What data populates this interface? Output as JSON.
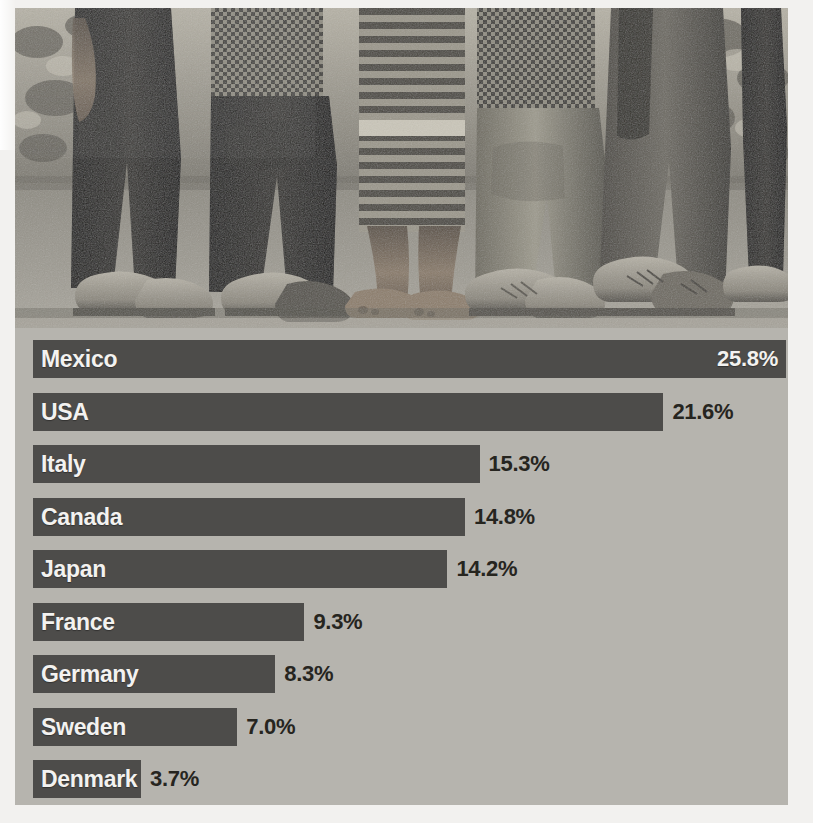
{
  "figure": {
    "type": "horizontal-bar-chart-over-photo",
    "photo_caption_alt": "Lower bodies and feet of a group of children standing on dirt ground, some in shoes, one barefoot"
  },
  "colors": {
    "bar": "#4d4c4a",
    "panel_background": "#b6b4ae",
    "page_background": "#ffffff",
    "label_text": "#f3f2f0",
    "value_text": "#26251f"
  },
  "chart_data": {
    "type": "bar",
    "orientation": "horizontal",
    "title": "",
    "xlabel": "",
    "ylabel": "",
    "grid": false,
    "legend": null,
    "value_suffix": "%",
    "xlim": [
      0,
      25.8
    ],
    "categories": [
      "Mexico",
      "USA",
      "Italy",
      "Canada",
      "Japan",
      "France",
      "Germany",
      "Sweden",
      "Denmark"
    ],
    "values": [
      25.8,
      21.6,
      15.3,
      14.8,
      14.2,
      9.3,
      8.3,
      7.0,
      3.7
    ],
    "value_labels": [
      "25.8%",
      "21.6%",
      "15.3%",
      "14.8%",
      "14.2%",
      "9.3%",
      "8.3%",
      "7.0%",
      "3.7%"
    ],
    "bars": [
      {
        "label": "Mexico",
        "value": 25.8,
        "value_label": "25.8%",
        "label_inside": true,
        "value_inside": true
      },
      {
        "label": "USA",
        "value": 21.6,
        "value_label": "21.6%",
        "label_inside": true,
        "value_inside": false
      },
      {
        "label": "Italy",
        "value": 15.3,
        "value_label": "15.3%",
        "label_inside": true,
        "value_inside": false
      },
      {
        "label": "Canada",
        "value": 14.8,
        "value_label": "14.8%",
        "label_inside": true,
        "value_inside": false
      },
      {
        "label": "Japan",
        "value": 14.2,
        "value_label": "14.2%",
        "label_inside": true,
        "value_inside": false
      },
      {
        "label": "France",
        "value": 9.3,
        "value_label": "9.3%",
        "label_inside": true,
        "value_inside": false
      },
      {
        "label": "Germany",
        "value": 8.3,
        "value_label": "8.3%",
        "label_inside": true,
        "value_inside": false
      },
      {
        "label": "Sweden",
        "value": 7.0,
        "value_label": "7.0%",
        "label_inside": true,
        "value_inside": false
      },
      {
        "label": "Denmark",
        "value": 3.7,
        "value_label": "3.7%",
        "label_inside": true,
        "value_inside": false
      }
    ]
  }
}
